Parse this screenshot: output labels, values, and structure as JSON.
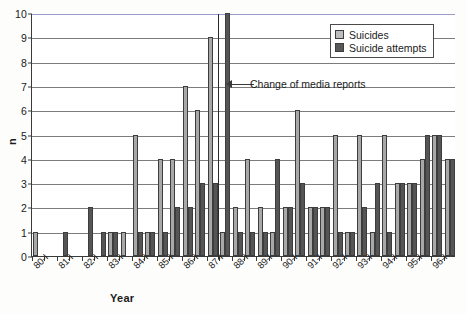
{
  "chart_data": {
    "type": "bar",
    "title": "",
    "xlabel": "Year",
    "ylabel": "n",
    "ylim": [
      0,
      10
    ],
    "yticks": [
      0,
      1,
      2,
      3,
      4,
      5,
      6,
      7,
      8,
      9,
      10
    ],
    "grid": true,
    "legend_position": "top-right",
    "categories": [
      "80-I",
      "80-II",
      "81-I",
      "81-II",
      "82-I",
      "82-II",
      "83-I",
      "83-II",
      "84-I",
      "84-II",
      "85-I",
      "85-II",
      "86-I",
      "86-II",
      "87-I",
      "87-II",
      "88-I",
      "88-II",
      "89-I",
      "89-II",
      "90-I",
      "90-II",
      "91-I",
      "91-II",
      "92-I",
      "92-II",
      "93-I",
      "93-II",
      "94-I",
      "94-II",
      "95-I",
      "95-II",
      "96-I",
      "96-II"
    ],
    "tick_labels": [
      "80-I",
      "81-I",
      "82-I",
      "83-I",
      "84-I",
      "85-I",
      "86-I",
      "87-I",
      "88-I",
      "89-I",
      "90-I",
      "91-I",
      "92-I",
      "93-I",
      "94-I",
      "95-I",
      "96-I"
    ],
    "series": [
      {
        "name": "Suicides",
        "color": "#a8a8a8",
        "values": [
          1,
          0,
          0,
          0,
          0,
          0,
          1,
          1,
          5,
          1,
          4,
          4,
          7,
          6,
          9,
          1,
          2,
          4,
          2,
          1,
          2,
          6,
          2,
          2,
          5,
          1,
          5,
          1,
          5,
          3,
          3,
          4,
          5,
          4
        ]
      },
      {
        "name": "Suicide attempts",
        "color": "#555555",
        "values": [
          0,
          0,
          1,
          0,
          2,
          1,
          1,
          0,
          1,
          1,
          1,
          2,
          2,
          3,
          3,
          10,
          1,
          1,
          1,
          4,
          2,
          3,
          2,
          2,
          1,
          1,
          2,
          3,
          1,
          3,
          3,
          5,
          5,
          4
        ]
      }
    ],
    "annotations": [
      {
        "text": "Change of media reports",
        "at_category": "87-II"
      }
    ]
  },
  "legend": {
    "items": [
      {
        "label": "Suicides",
        "swatch": "light-gray"
      },
      {
        "label": "Suicide attempts",
        "swatch": "dark-gray"
      }
    ]
  },
  "axes": {
    "y_label": "n",
    "x_label": "Year"
  },
  "caption": ""
}
